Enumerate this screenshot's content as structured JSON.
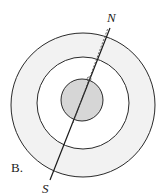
{
  "figure": {
    "option_label": "B.",
    "north_label": "N",
    "south_label": "S",
    "colors": {
      "stroke": "#2a2a2a",
      "outer_ring_fill": "#f2f2f2",
      "middle_fill": "#ffffff",
      "core_fill": "#d6d6d6",
      "background": "#ffffff"
    }
  }
}
